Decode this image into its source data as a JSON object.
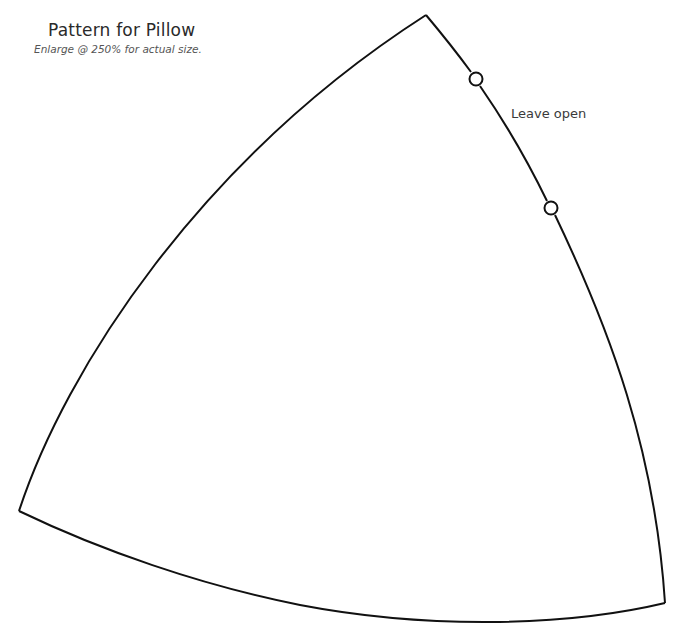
{
  "header": {
    "title": "Pattern for Pillow",
    "subtitle": "Enlarge @ 250% for actual size."
  },
  "annotations": {
    "leave_open": "Leave open"
  },
  "pattern": {
    "shape": "curved-triangle",
    "stroke_color": "#111111",
    "vertices": {
      "top": [
        426,
        15
      ],
      "bottom_left": [
        19,
        511
      ],
      "bottom_right": [
        665,
        603
      ]
    },
    "markers": [
      {
        "name": "opening-start",
        "cx": 476,
        "cy": 79
      },
      {
        "name": "opening-end",
        "cx": 551,
        "cy": 208
      }
    ]
  }
}
